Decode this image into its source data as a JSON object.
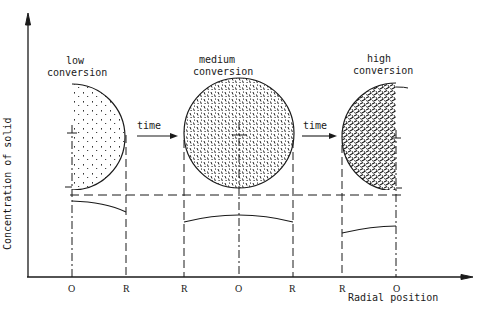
{
  "diagram": {
    "y_axis_label": "Concentration of solid",
    "x_axis_label": "Radial position",
    "stages": [
      {
        "id": "low",
        "label_line1": "low",
        "label_line2": "conversion",
        "ticks": [
          "O",
          "R"
        ]
      },
      {
        "id": "medium",
        "label_line1": "medium",
        "label_line2": "conversion",
        "ticks": [
          "R",
          "O",
          "R"
        ]
      },
      {
        "id": "high",
        "label_line1": "high",
        "label_line2": "conversion",
        "ticks": [
          "R",
          "O"
        ]
      }
    ],
    "arrows": [
      {
        "label": "time"
      },
      {
        "label": "time"
      }
    ],
    "colors": {
      "ink": "#1a1a1a",
      "background": "#ffffff"
    }
  }
}
